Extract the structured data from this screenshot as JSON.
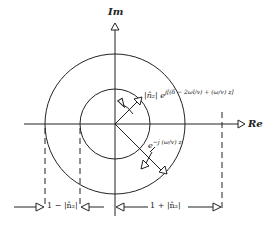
{
  "axes": {
    "imaginary_label": "Im",
    "real_label": "Re"
  },
  "annotations": {
    "rotating_phasor": "|n̂₂| e^{j[(δ − 2ωl/v) + (ω/v) z]}",
    "rotating_phasor_short": "|n̂₂| e",
    "rotating_phasor_exp": "j[(δ − 2ωl/v) + (ω/v) z]",
    "decaying_phasor": "e",
    "decaying_phasor_exp": "−j (ω/v) z",
    "min_label": "1 − |n̂₂|",
    "max_label": "1 + |n̂₂|"
  },
  "geometry": {
    "center": [
      115,
      124
    ],
    "outer_radius": 70,
    "inner_radius": 35
  }
}
